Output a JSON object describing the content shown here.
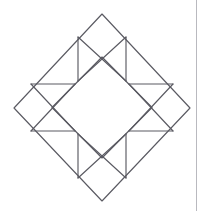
{
  "document": {
    "title": "Geometric Diamond Star Figure",
    "background_color": "#ffffff",
    "width": 202,
    "height": 211,
    "description": "Line drawing of a quilt-block style geometric figure: a large diamond (square rotated 45 degrees) containing a smaller central diamond, with four star-point triangles and small corner squares."
  },
  "frame": {
    "right_rule_color": "#b9b9bf",
    "right_rule_x": 196
  },
  "figure": {
    "stroke_color": "#5a5a62",
    "stroke_width": 1.15,
    "fill": "none",
    "center": {
      "x": 102,
      "y": 107.5
    },
    "outer_diamond": {
      "name": "outer-diamond",
      "points": "102,14 190,108 102,201 14,108",
      "vertices": [
        {
          "label": "top",
          "x": 102,
          "y": 14
        },
        {
          "label": "right",
          "x": 190,
          "y": 108
        },
        {
          "label": "bottom",
          "x": 102,
          "y": 201
        },
        {
          "label": "left",
          "x": 14,
          "y": 108
        }
      ]
    },
    "inner_diamond": {
      "name": "inner-diamond",
      "points": "102,57 152,107.5 102,158 52,107.5",
      "vertices": [
        {
          "label": "top",
          "x": 102,
          "y": 57
        },
        {
          "label": "right",
          "x": 152,
          "y": 107.5
        },
        {
          "label": "bottom",
          "x": 102,
          "y": 158
        },
        {
          "label": "left",
          "x": 52,
          "y": 107.5
        }
      ]
    },
    "bars": [
      {
        "name": "bar-top-left",
        "x1": 78,
        "y1": 37,
        "x2": 78,
        "y2": 81
      },
      {
        "name": "bar-top-right",
        "x1": 126,
        "y1": 37,
        "x2": 126,
        "y2": 81
      },
      {
        "name": "bar-bottom-left",
        "x1": 78,
        "y1": 134,
        "x2": 78,
        "y2": 178
      },
      {
        "name": "bar-bottom-right",
        "x1": 126,
        "y1": 134,
        "x2": 126,
        "y2": 178
      },
      {
        "name": "bar-left-top",
        "x1": 31,
        "y1": 84,
        "x2": 75,
        "y2": 84
      },
      {
        "name": "bar-left-bottom",
        "x1": 31,
        "y1": 131,
        "x2": 75,
        "y2": 131
      },
      {
        "name": "bar-right-top",
        "x1": 129,
        "y1": 84,
        "x2": 173,
        "y2": 84
      },
      {
        "name": "bar-right-bottom",
        "x1": 129,
        "y1": 131,
        "x2": 173,
        "y2": 131
      }
    ],
    "diagonals": [
      {
        "name": "diagonal-top-left-to-center",
        "x1": 78,
        "y1": 37,
        "x2": 126,
        "y2": 81
      },
      {
        "name": "diagonal-top-right-to-center",
        "x1": 126,
        "y1": 37,
        "x2": 78,
        "y2": 81
      },
      {
        "name": "diagonal-bottom-left-to-center",
        "x1": 78,
        "y1": 178,
        "x2": 126,
        "y2": 134
      },
      {
        "name": "diagonal-bottom-right-to-center",
        "x1": 126,
        "y1": 178,
        "x2": 78,
        "y2": 134
      },
      {
        "name": "diagonal-left-top-to-center",
        "x1": 31,
        "y1": 84,
        "x2": 75,
        "y2": 131
      },
      {
        "name": "diagonal-left-bottom-to-center",
        "x1": 31,
        "y1": 131,
        "x2": 75,
        "y2": 84
      },
      {
        "name": "diagonal-right-top-to-center",
        "x1": 173,
        "y1": 84,
        "x2": 129,
        "y2": 131
      },
      {
        "name": "diagonal-right-bottom-to-center",
        "x1": 173,
        "y1": 131,
        "x2": 129,
        "y2": 84
      }
    ],
    "star_points": [
      {
        "name": "star-point-top",
        "points": "78,81 102,57 126,81"
      },
      {
        "name": "star-point-right",
        "points": "129,84 152,107.5 129,131"
      },
      {
        "name": "star-point-bottom",
        "points": "78,134 102,158 126,134"
      },
      {
        "name": "star-point-left",
        "points": "75,84 52,107.5 75,131"
      }
    ],
    "corner_squares": [
      {
        "name": "corner-square-top",
        "points": "78,37 102,14 126,37 102,60"
      },
      {
        "name": "corner-square-left",
        "points": "31,84 14,108 31,131"
      },
      {
        "name": "corner-square-right",
        "points": "173,84 190,108 173,131"
      },
      {
        "name": "corner-square-bottom",
        "points": "78,178 102,201 126,178"
      }
    ]
  }
}
